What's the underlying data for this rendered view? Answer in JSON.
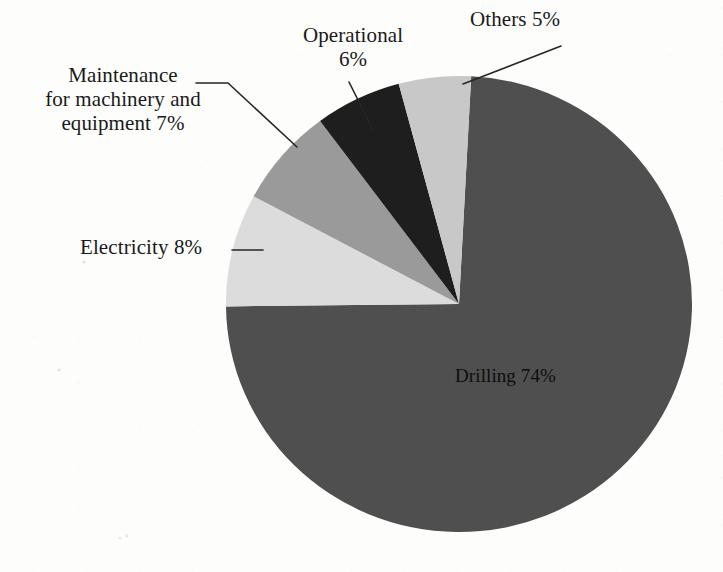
{
  "figure": {
    "title": "",
    "background_color": "#fdfdfc"
  },
  "chart_data": {
    "type": "pie",
    "title": "",
    "xlabel": "",
    "ylabel": "",
    "unit": "%",
    "legend_position": "none",
    "grid": false,
    "label_style": "callout labels with leader lines",
    "total": 100,
    "categories": [
      "Drilling",
      "Electricity",
      "Maintenance for machinery and equipment",
      "Operational",
      "Others"
    ],
    "values": [
      74,
      8,
      7,
      6,
      5
    ],
    "slices": [
      {
        "name": "Drilling",
        "label_text": "Drilling 74%",
        "value": 74,
        "percent_text": "74%",
        "color": "#4f4f4f",
        "start_angle_deg": 3,
        "end_angle_deg": 269,
        "label_placement": "inside"
      },
      {
        "name": "Electricity",
        "label_text": "Electricity 8%",
        "value": 8,
        "percent_text": "8%",
        "color": "#dcdcdc",
        "start_angle_deg": 269,
        "end_angle_deg": 298,
        "label_placement": "outside-left"
      },
      {
        "name": "Maintenance for machinery and equipment",
        "label_text": "Maintenance\nfor machinery and\nequipment 7%",
        "value": 7,
        "percent_text": "7%",
        "color": "#9a9a9a",
        "start_angle_deg": 298,
        "end_angle_deg": 323,
        "label_placement": "outside-upper-left"
      },
      {
        "name": "Operational",
        "label_text": "Operational\n6%",
        "value": 6,
        "percent_text": "6%",
        "color": "#1e1e1e",
        "start_angle_deg": 323,
        "end_angle_deg": 345,
        "label_placement": "outside-top"
      },
      {
        "name": "Others",
        "label_text": "Others 5%",
        "value": 5,
        "percent_text": "5%",
        "color": "#c8c8c8",
        "start_angle_deg": 345,
        "end_angle_deg": 363,
        "label_placement": "outside-top-right"
      }
    ]
  },
  "labels": {
    "others": "Others 5%",
    "operational": "Operational\n6%",
    "maintenance": "Maintenance\nfor machinery and\nequipment 7%",
    "electricity": "Electricity 8%",
    "drilling": "Drilling 74%"
  }
}
